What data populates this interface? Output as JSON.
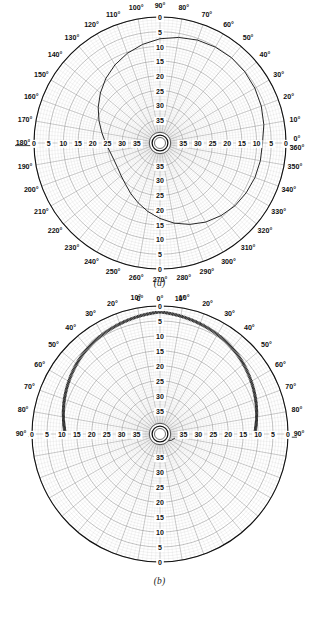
{
  "figure": {
    "background": "#ffffff",
    "ink": "#101010",
    "grid_color": "#8a8a8a",
    "trace_color": "#1a1a1a"
  },
  "charts": [
    {
      "id": "chart-a",
      "caption": "(a)",
      "type": "polar-recorder-chart",
      "angular_range_deg": [
        0,
        360
      ],
      "angular_tick_step_deg": 10,
      "angle_labels": [
        "0°",
        "10°",
        "20°",
        "30°",
        "40°",
        "50°",
        "60°",
        "70°",
        "80°",
        "90°",
        "100°",
        "110°",
        "120°",
        "130°",
        "140°",
        "150°",
        "160°",
        "170°",
        "180°",
        "190°",
        "200°",
        "210°",
        "220°",
        "230°",
        "240°",
        "250°",
        "260°",
        "270°",
        "280°",
        "290°",
        "300°",
        "310°",
        "320°",
        "330°",
        "340°",
        "350°",
        "360°"
      ],
      "origin_label_top": "0°",
      "origin_label_bottom": "360°",
      "radial_labels_outward_to_center": [
        "0",
        "5",
        "10",
        "15",
        "20",
        "25",
        "30",
        "35"
      ],
      "radial_scale_inverted": true,
      "radial_max": 40,
      "radial_tick_step": 5,
      "hub": "center-hub-circle"
    },
    {
      "id": "chart-b",
      "caption": "(b)",
      "type": "polar-recorder-chart",
      "angular_range_deg": [
        0,
        90
      ],
      "angular_mirrored": true,
      "angular_tick_step_deg": 10,
      "angle_labels_left": [
        "0°",
        "10°",
        "20°",
        "30°",
        "40°",
        "50°",
        "60°",
        "70°",
        "80°",
        "90°"
      ],
      "angle_labels_right": [
        "0°",
        "10°",
        "20°",
        "30°",
        "40°",
        "50°",
        "60°",
        "70°",
        "80°",
        "90°"
      ],
      "radial_labels_outward_to_center": [
        "0",
        "5",
        "10",
        "15",
        "20",
        "25",
        "30",
        "35"
      ],
      "radial_labels_bottom_center_to_outward": [
        "35",
        "30",
        "25",
        "20",
        "15",
        "10",
        "5",
        "0"
      ],
      "radial_scale_inverted": true,
      "radial_max": 40,
      "radial_tick_step": 5,
      "hub": "center-hub-circle"
    }
  ],
  "chart_data": [
    {
      "type": "line",
      "subplot": "(a)",
      "title": "",
      "polar": true,
      "xlabel": "Angle (degrees)",
      "ylabel": "Recorded value",
      "grid": true,
      "legend": null,
      "theta_unit": "degrees",
      "rlim": [
        0,
        40
      ],
      "r_inverted_from_rim": true,
      "r_ticks": [
        0,
        5,
        10,
        15,
        20,
        25,
        30,
        35
      ],
      "theta_ticks": [
        0,
        10,
        20,
        30,
        40,
        50,
        60,
        70,
        80,
        90,
        100,
        110,
        120,
        130,
        140,
        150,
        160,
        170,
        180,
        190,
        200,
        210,
        220,
        230,
        240,
        250,
        260,
        270,
        280,
        290,
        300,
        310,
        320,
        330,
        340,
        350,
        360
      ],
      "series": [
        {
          "name": "trace-a",
          "theta": [
            0,
            10,
            20,
            30,
            40,
            50,
            60,
            70,
            80,
            90,
            100,
            110,
            120,
            130,
            140,
            150,
            160,
            170,
            180,
            190,
            200,
            210,
            220,
            230,
            240,
            250,
            260,
            270,
            280,
            290,
            300,
            310,
            320,
            330,
            340,
            350,
            360
          ],
          "r": [
            8,
            7,
            6.2,
            5.6,
            5.2,
            5.0,
            5.2,
            5.6,
            6.4,
            7.4,
            8.8,
            10.4,
            12.2,
            14.2,
            16.4,
            18.6,
            20.8,
            22.8,
            24.4,
            25.6,
            26.2,
            26.2,
            25.6,
            24.6,
            23.0,
            21.2,
            19.2,
            17.2,
            15.2,
            13.4,
            11.8,
            10.6,
            9.6,
            9.0,
            8.5,
            8.2,
            8.0
          ]
        }
      ]
    },
    {
      "type": "line",
      "subplot": "(b)",
      "title": "",
      "polar": true,
      "xlabel": "Angle (degrees)",
      "ylabel": "Recorded value",
      "grid": true,
      "legend": null,
      "theta_unit": "degrees",
      "rlim": [
        0,
        40
      ],
      "r_inverted_from_rim": true,
      "r_ticks": [
        0,
        5,
        10,
        15,
        20,
        25,
        30,
        35
      ],
      "theta_ticks": [
        0,
        10,
        20,
        30,
        40,
        50,
        60,
        70,
        80,
        90
      ],
      "series": [
        {
          "name": "trace-b-left",
          "note": "oscillating band near rim",
          "theta": [
            0,
            5,
            10,
            15,
            20,
            25,
            30,
            35,
            40,
            45,
            50,
            55,
            60,
            65,
            70,
            75,
            80,
            85,
            90
          ],
          "r": [
            2.0,
            2.4,
            2.8,
            3.2,
            3.6,
            4.0,
            4.4,
            4.8,
            5.3,
            5.8,
            6.4,
            7.0,
            7.6,
            8.2,
            8.8,
            9.4,
            10.0,
            10.6,
            11.2
          ],
          "oscillation_amplitude": 0.9
        },
        {
          "name": "trace-b-right",
          "note": "oscillating band near rim, mirrored",
          "theta": [
            0,
            5,
            10,
            15,
            20,
            25,
            30,
            35,
            40,
            45,
            50,
            55,
            60,
            65,
            70,
            75,
            80,
            85,
            90
          ],
          "r": [
            2.0,
            2.4,
            2.8,
            3.2,
            3.6,
            4.0,
            4.4,
            4.8,
            5.3,
            5.8,
            6.4,
            7.0,
            7.6,
            8.2,
            8.8,
            9.4,
            10.0,
            10.6,
            11.2
          ],
          "oscillation_amplitude": 0.9
        }
      ]
    }
  ]
}
